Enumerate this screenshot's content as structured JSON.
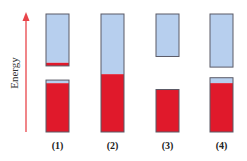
{
  "diagram": {
    "axis_label": "Energy",
    "colors": {
      "empty": "#b7cfee",
      "filled": "#e0192b",
      "border": "#5a5a66",
      "arrow": "#e8444a"
    },
    "panels": [
      {
        "label": "(1)",
        "bands": [
          {
            "name": "upper-band",
            "top": 1.0,
            "bottom": 0.56,
            "filled_fraction": 0.06
          },
          {
            "name": "lower-band",
            "top": 0.44,
            "bottom": 0.0,
            "filled_fraction": 0.94
          }
        ]
      },
      {
        "label": "(2)",
        "bands": [
          {
            "name": "single-band",
            "top": 1.0,
            "bottom": 0.0,
            "filled_fraction": 0.49
          }
        ]
      },
      {
        "label": "(3)",
        "bands": [
          {
            "name": "upper-band",
            "top": 1.0,
            "bottom": 0.64,
            "filled_fraction": 0.0
          },
          {
            "name": "lower-band",
            "top": 0.36,
            "bottom": 0.0,
            "filled_fraction": 1.0
          }
        ]
      },
      {
        "label": "(4)",
        "bands": [
          {
            "name": "upper-band",
            "top": 1.0,
            "bottom": 0.55,
            "filled_fraction": 0.0
          },
          {
            "name": "lower-band",
            "top": 0.46,
            "bottom": 0.0,
            "filled_fraction": 0.9
          }
        ]
      }
    ]
  }
}
